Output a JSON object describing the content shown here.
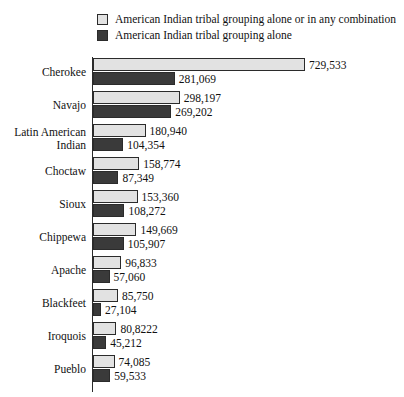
{
  "legend": {
    "items": [
      {
        "label": "American Indian tribal grouping alone or in any combination",
        "swatch": "light",
        "color": "#e2e2e2"
      },
      {
        "label": "American Indian tribal grouping alone",
        "swatch": "dark",
        "color": "#3a3a3a"
      }
    ]
  },
  "chart_data": {
    "type": "bar",
    "orientation": "horizontal",
    "title": "",
    "xlabel": "",
    "ylabel": "",
    "grid": false,
    "legend_position": "top",
    "xlim": [
      0,
      729533
    ],
    "categories": [
      "Cherokee",
      "Navajo",
      "Latin American\nIndian",
      "Choctaw",
      "Sioux",
      "Chippewa",
      "Apache",
      "Blackfeet",
      "Iroquois",
      "Pueblo"
    ],
    "series": [
      {
        "name": "American Indian tribal grouping alone or in any combination",
        "color": "#e2e2e2",
        "values": [
          729533,
          298197,
          180940,
          158774,
          153360,
          149669,
          96833,
          85750,
          80822,
          74085
        ],
        "labels": [
          "729,533",
          "298,197",
          "180,940",
          "158,774",
          "153,360",
          "149,669",
          "96,833",
          "85,750",
          "80,8222",
          "74,085"
        ]
      },
      {
        "name": "American Indian tribal grouping alone",
        "color": "#3a3a3a",
        "values": [
          281069,
          269202,
          104354,
          87349,
          108272,
          105907,
          57060,
          27104,
          45212,
          59533
        ],
        "labels": [
          "281,069",
          "269,202",
          "104,354",
          "87,349",
          "108,272",
          "105,907",
          "57,060",
          "27,104",
          "45,212",
          "59,533"
        ]
      }
    ]
  }
}
